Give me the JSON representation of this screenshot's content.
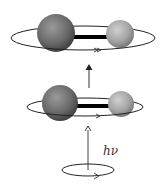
{
  "diagram": {
    "photon_label": "hν",
    "states": [
      {
        "name": "excited-rotational-state",
        "ring_size": "large"
      },
      {
        "name": "ground-rotational-state",
        "ring_size": "small"
      }
    ],
    "colors": {
      "large_atom": "#6e6e6e",
      "small_atom": "#a8a8a8",
      "bond": "#000000",
      "ring": "#222222",
      "arrow": "#333333"
    }
  }
}
